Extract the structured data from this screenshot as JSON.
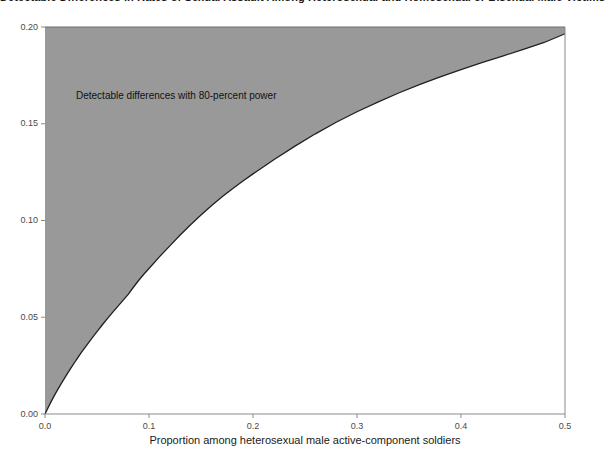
{
  "chart_data": {
    "type": "area",
    "title": "Detectable Differences in Rates of Sexual Assault Among Heterosexual and Homosexual or Bisexual Male Victims",
    "xlabel": "Proportion among heterosexual male active-component soldiers",
    "ylabel": "",
    "xlim": [
      0.0,
      0.5
    ],
    "ylim": [
      0.0,
      0.2
    ],
    "xticks": [
      0.0,
      0.1,
      0.2,
      0.3,
      0.4,
      0.5
    ],
    "xtick_labels": [
      "0.0",
      "0.1",
      "0.2",
      "0.3",
      "0.4",
      "0.5"
    ],
    "yticks": [
      0.0,
      0.05,
      0.1,
      0.15,
      0.2
    ],
    "ytick_labels": [
      "0.00",
      "0.05",
      "0.10",
      "0.15",
      "0.20"
    ],
    "grid": false,
    "legend": null,
    "annotations": [
      {
        "text": "Detectable differences with 80-percent power",
        "x": 0.03,
        "y": 0.173
      }
    ],
    "fill_color": "#999999",
    "line_color": "#231f20",
    "series": [
      {
        "name": "Upper bound of detectable difference",
        "x": [
          0.0,
          0.005,
          0.01,
          0.015,
          0.02,
          0.025,
          0.03,
          0.035,
          0.04,
          0.045,
          0.05,
          0.055,
          0.06,
          0.065,
          0.07,
          0.075,
          0.08,
          0.085,
          0.09,
          0.095,
          0.1,
          0.11,
          0.12,
          0.13,
          0.14,
          0.15,
          0.16,
          0.17,
          0.18,
          0.19,
          0.2,
          0.22,
          0.24,
          0.26,
          0.28,
          0.3,
          0.32,
          0.34,
          0.36,
          0.38,
          0.4,
          0.42,
          0.44,
          0.46,
          0.48,
          0.5
        ],
        "y": [
          0.0,
          0.0055,
          0.0105,
          0.0152,
          0.0196,
          0.0238,
          0.0279,
          0.0318,
          0.0355,
          0.0391,
          0.0426,
          0.046,
          0.0493,
          0.0525,
          0.0556,
          0.0587,
          0.0618,
          0.0655,
          0.069,
          0.0722,
          0.0752,
          0.0812,
          0.0869,
          0.0925,
          0.0978,
          0.1028,
          0.1076,
          0.1121,
          0.1163,
          0.1203,
          0.1241,
          0.1314,
          0.1383,
          0.1448,
          0.1508,
          0.1562,
          0.1612,
          0.1659,
          0.1702,
          0.1742,
          0.178,
          0.1816,
          0.185,
          0.1884,
          0.192,
          0.1965
        ]
      }
    ],
    "area_description": "Shaded region spans from the curve up to the top of the plot (y = 0.20), representing differences detectable with 80-percent power."
  },
  "axes": {
    "x_title": "Proportion among heterosexual male active-component soldiers",
    "x_tick_labels": [
      "0.0",
      "0.1",
      "0.2",
      "0.3",
      "0.4",
      "0.5"
    ],
    "y_tick_labels": [
      "0.00",
      "0.05",
      "0.10",
      "0.15",
      "0.20"
    ]
  },
  "annotation": {
    "text": "Detectable differences with 80-percent power"
  },
  "title": {
    "text": "Detectable Differences in Rates of Sexual Assault Among Heterosexual and Homosexual or Bisexual Male Victims"
  }
}
